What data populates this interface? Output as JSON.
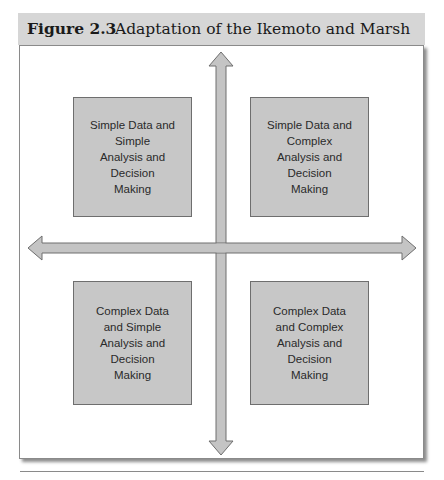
{
  "figure": {
    "label": "Figure 2.3",
    "title": "Adaptation of the Ikemoto and Marsh Framework"
  },
  "quadrants": {
    "top_left": [
      "Simple Data and",
      "Simple",
      "Analysis and",
      "Decision",
      "Making"
    ],
    "top_right": [
      "Simple Data and",
      "Complex",
      "Analysis and",
      "Decision",
      "Making"
    ],
    "bottom_left": [
      "Complex Data",
      "and Simple",
      "Analysis and",
      "Decision",
      "Making"
    ],
    "bottom_right": [
      "Complex Data",
      "and Complex",
      "Analysis and",
      "Decision",
      "Making"
    ]
  },
  "colors": {
    "header_bg": "#d6d6d6",
    "box_fill": "#c7c7c7",
    "arrow_fill": "#c4c4c4",
    "outline": "#6e6e6e"
  }
}
